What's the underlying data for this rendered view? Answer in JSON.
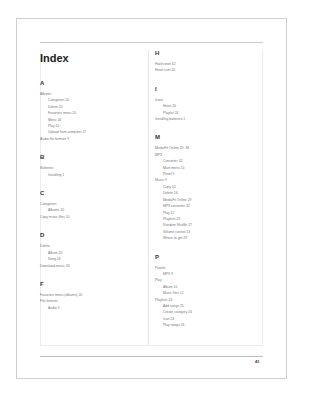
{
  "page": {
    "title": "Index",
    "page_number": "41",
    "left_column": [
      {
        "letter": "A",
        "entries": [
          {
            "text": "Albums",
            "level": 0
          },
          {
            "text": "Categories 20",
            "level": 1
          },
          {
            "text": "Delete 20",
            "level": 1
          },
          {
            "text": "Favorites menu 20",
            "level": 1
          },
          {
            "text": "Menu 16",
            "level": 1
          },
          {
            "text": "Play 10",
            "level": 1
          },
          {
            "text": "Upload from computer 17",
            "level": 1
          },
          {
            "text": "Audio file formats 9",
            "level": 0
          }
        ]
      },
      {
        "letter": "B",
        "entries": [
          {
            "text": "Batteries",
            "level": 0
          },
          {
            "text": "Installing 1",
            "level": 1
          }
        ]
      },
      {
        "letter": "C",
        "entries": [
          {
            "text": "Categories",
            "level": 0
          },
          {
            "text": "Albums 20",
            "level": 1
          },
          {
            "text": "Copy music files 10",
            "level": 0
          }
        ]
      },
      {
        "letter": "D",
        "entries": [
          {
            "text": "Delete",
            "level": 0
          },
          {
            "text": "Album 20",
            "level": 1
          },
          {
            "text": "Song 16",
            "level": 1
          },
          {
            "text": "Download music 33",
            "level": 0
          }
        ]
      },
      {
        "letter": "F",
        "entries": [
          {
            "text": "Favorites menu (albums) 20",
            "level": 0
          },
          {
            "text": "File formats",
            "level": 0
          },
          {
            "text": "Audio 9",
            "level": 1
          }
        ]
      }
    ],
    "right_column": [
      {
        "letter": "H",
        "entries": [
          {
            "text": "Hard reset 42",
            "level": 0
          },
          {
            "text": "Heart icon 20",
            "level": 0
          }
        ]
      },
      {
        "letter": "I",
        "entries": [
          {
            "text": "Icons",
            "level": 0
          },
          {
            "text": "Heart 20",
            "level": 1
          },
          {
            "text": "Playlist 24",
            "level": 1
          },
          {
            "text": "Installing batteries 1",
            "level": 0
          }
        ]
      },
      {
        "letter": "M",
        "entries": [
          {
            "text": "MediaFit Online 29, 38",
            "level": 0
          },
          {
            "text": "MP3",
            "level": 0
          },
          {
            "text": "Converter 32",
            "level": 1
          },
          {
            "text": "Main menu 10",
            "level": 1
          },
          {
            "text": "Panel 9",
            "level": 1
          },
          {
            "text": "Music 9",
            "level": 0
          },
          {
            "text": "Copy 10",
            "level": 1
          },
          {
            "text": "Delete 16",
            "level": 1
          },
          {
            "text": "MediaFit Online 29",
            "level": 1
          },
          {
            "text": "MP3 converter 32",
            "level": 1
          },
          {
            "text": "Play 12",
            "level": 1
          },
          {
            "text": "Playlists 23",
            "level": 1
          },
          {
            "text": "Random Shuffle 27",
            "level": 1
          },
          {
            "text": "Volume control 13",
            "level": 1
          },
          {
            "text": "Where to get 29",
            "level": 1
          }
        ]
      },
      {
        "letter": "P",
        "entries": [
          {
            "text": "Panels",
            "level": 0
          },
          {
            "text": "MP3 9",
            "level": 1
          },
          {
            "text": "Play",
            "level": 0
          },
          {
            "text": "Album 10",
            "level": 1
          },
          {
            "text": "Music files 12",
            "level": 1
          },
          {
            "text": "Playlists 23",
            "level": 0
          },
          {
            "text": "Add songs 25",
            "level": 1
          },
          {
            "text": "Create category 24",
            "level": 1
          },
          {
            "text": "Icon 24",
            "level": 1
          },
          {
            "text": "Play songs 26",
            "level": 1
          }
        ]
      }
    ]
  }
}
